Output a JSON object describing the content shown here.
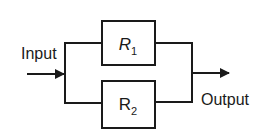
{
  "diagram": {
    "type": "parallel-block-diagram",
    "input_label": "Input",
    "output_label": "Output",
    "blocks": [
      {
        "id": "r1",
        "label_main": "R",
        "label_sub": "1",
        "italic": true
      },
      {
        "id": "r2",
        "label_main": "R",
        "label_sub": "2",
        "italic": false
      }
    ],
    "colors": {
      "line": "#1a1a1a",
      "background": "#ffffff"
    }
  }
}
